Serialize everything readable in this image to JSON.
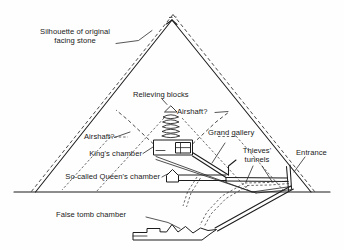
{
  "figure": {
    "background_color": "#fefefe",
    "ink_color": "#1c1c1c",
    "ground_line_y": 192
  },
  "labels": {
    "silhouette": "Silhouette of original\nfacing stone",
    "relieving_blocks": "Relieving blocks",
    "airshaft_right": "Airshaft?",
    "airshaft_left": "Airshaft?",
    "grand_gallery": "Grand gallery",
    "kings_chamber": "King's chamber",
    "thieves_tunnels": "Thieves'\ntunnels",
    "entrance": "Entrance",
    "queens_chamber": "So-called Queen's chamber",
    "false_tomb_chamber": "False tomb chamber"
  },
  "structures": [
    {
      "name": "pyramid-outline",
      "style": "solid"
    },
    {
      "name": "facing-stone-silhouette",
      "style": "dashed"
    },
    {
      "name": "ground-line",
      "style": "solid"
    },
    {
      "name": "kings-chamber",
      "style": "solid"
    },
    {
      "name": "relieving-blocks",
      "style": "solid",
      "count": 5
    },
    {
      "name": "airshaft-left",
      "style": "dashed"
    },
    {
      "name": "airshaft-right",
      "style": "dashed"
    },
    {
      "name": "grand-gallery",
      "style": "solid"
    },
    {
      "name": "queens-chamber",
      "style": "solid"
    },
    {
      "name": "entrance-passage",
      "style": "solid"
    },
    {
      "name": "thieves-tunnels",
      "style": "dashed"
    },
    {
      "name": "descending-passage",
      "style": "solid"
    },
    {
      "name": "false-tomb-chamber",
      "style": "solid"
    }
  ]
}
